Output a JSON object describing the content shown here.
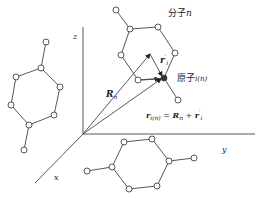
{
  "diagram": {
    "axes": {
      "origin": [
        83,
        134
      ],
      "x": {
        "label": "x",
        "end": [
          35,
          183
        ]
      },
      "y": {
        "label": "y",
        "end": [
          255,
          134
        ]
      },
      "z": {
        "label": "z",
        "end": [
          83,
          27
        ]
      }
    },
    "labels": {
      "molecule": "分子",
      "molecule_var": "n",
      "atom": "原子",
      "atom_var": "i(n)",
      "R_n": "R",
      "R_n_sub": "n",
      "r_prime": "r",
      "r_prime_sub": "i",
      "r_prime_sup": "′",
      "equation_lhs": "r",
      "equation_lhs_sub": "i(n)",
      "equation_eq": " = ",
      "equation_R": "R",
      "equation_R_sub": "n",
      "equation_plus": " + ",
      "equation_r": "r",
      "equation_r_sub": "i",
      "equation_r_sup": "′"
    },
    "colors": {
      "line": "#333333",
      "node_fill": "#ffffff"
    }
  }
}
